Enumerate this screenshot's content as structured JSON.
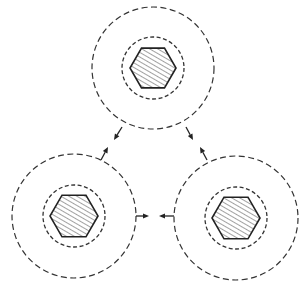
{
  "diagram": {
    "title": "",
    "colors": {
      "stroke": "#222222",
      "background": "#ffffff"
    },
    "nodes": [
      {
        "id": "top",
        "cx": 153,
        "cy": 68,
        "outer_r": 61,
        "inner_r": 31,
        "hex_r": 23
      },
      {
        "id": "bottom-left",
        "cx": 74,
        "cy": 216,
        "outer_r": 62,
        "inner_r": 31,
        "hex_r": 24
      },
      {
        "id": "bottom-right",
        "cx": 236,
        "cy": 218,
        "outer_r": 62,
        "inner_r": 31,
        "hex_r": 24
      }
    ],
    "arrows": [
      {
        "from": "top",
        "toward": "bottom-left",
        "x1": 122,
        "y1": 127,
        "x2": 114,
        "y2": 140
      },
      {
        "from": "bottom-left",
        "toward": "top",
        "x1": 101,
        "y1": 160,
        "x2": 108,
        "y2": 147
      },
      {
        "from": "top",
        "toward": "bottom-right",
        "x1": 186,
        "y1": 127,
        "x2": 193,
        "y2": 140
      },
      {
        "from": "bottom-right",
        "toward": "top",
        "x1": 207,
        "y1": 160,
        "x2": 200,
        "y2": 147
      },
      {
        "from": "bottom-left",
        "toward": "bottom-right",
        "x1": 136,
        "y1": 216,
        "x2": 149,
        "y2": 216
      },
      {
        "from": "bottom-right",
        "toward": "bottom-left",
        "x1": 174,
        "y1": 216,
        "x2": 159,
        "y2": 216
      }
    ]
  }
}
